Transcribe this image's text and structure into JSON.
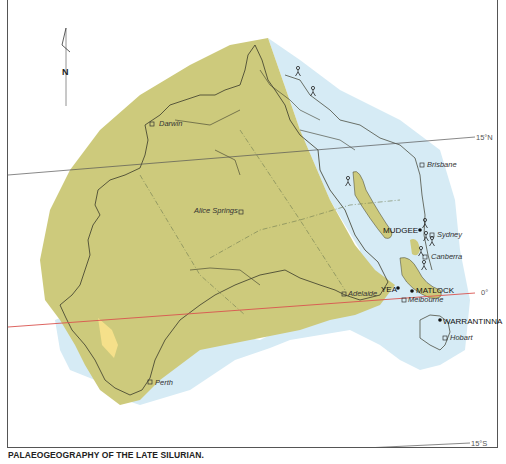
{
  "caption": "PALAEOGEOGRAPHY OF THE LATE SILURIAN.",
  "north_arrow": {
    "label": "N"
  },
  "latitudes": {
    "north": "15°N",
    "equator": "0°",
    "south": "15°S"
  },
  "cities": {
    "darwin": "Darwin",
    "alice_springs": "Alice Springs",
    "brisbane": "Brisbane",
    "sydney": "Sydney",
    "canberra": "Canberra",
    "adelaide": "Adelaide",
    "melbourne": "Melbourne",
    "hobart": "Hobart",
    "perth": "Perth"
  },
  "fossil_sites": {
    "mudgee": "MUDGEE",
    "yea": "YEA",
    "matlock": "MATLOCK",
    "warrantinna": "WARRANTINNA"
  },
  "colors": {
    "land": "#cdca7c",
    "shallow_sea": "#d6ebf5",
    "coastal_yellow": "#f5e08a",
    "equator_line": "#d9534f",
    "latitude_line": "#555555",
    "outline": "#3a3a2a"
  }
}
